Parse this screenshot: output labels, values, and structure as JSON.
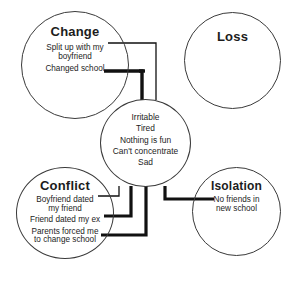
{
  "diagram": {
    "stroke_color": "#3a3a3a",
    "text_color": "#1c1c1c",
    "wire_color": "#111111",
    "background": "#ffffff"
  },
  "nodes": {
    "change": {
      "label": "Change",
      "items": [
        "Split up with my\nboyfriend",
        "Changed school"
      ]
    },
    "loss": {
      "label": "Loss",
      "items": []
    },
    "conflict": {
      "label": "Conflict",
      "items": [
        "Boyfriend dated\nmy friend",
        "Friend dated my ex",
        "Parents forced me\nto change school"
      ]
    },
    "isolation": {
      "label": "Isolation",
      "items": [
        "No friends in\nnew school"
      ]
    },
    "symptoms": {
      "label": "",
      "items": [
        "Irritable",
        "Tired",
        "Nothing is fun",
        "Can't concentrate",
        "Sad"
      ]
    }
  }
}
